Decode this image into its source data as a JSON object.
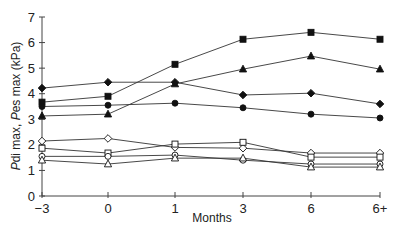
{
  "chart_data": {
    "type": "line",
    "title": "",
    "xlabel": "Months",
    "ylabel": "Pdi max, Pes max (kPa)",
    "ylabel_parts": [
      {
        "text": "P",
        "italic": true
      },
      {
        "text": "di max, ",
        "italic": false
      },
      {
        "text": "P",
        "italic": true
      },
      {
        "text": "es max (kPa)",
        "italic": false
      }
    ],
    "categories": [
      "-3",
      "0",
      "1",
      "3",
      "6",
      "6+"
    ],
    "x_tick_labels": [
      "−3",
      "0",
      "1",
      "3",
      "6",
      "6+"
    ],
    "y_ticks": [
      0,
      1,
      2,
      3,
      4,
      5,
      6,
      7
    ],
    "ylim": [
      0,
      7
    ],
    "grid": false,
    "legend": "none",
    "series": [
      {
        "name": "filled-square",
        "marker": "square",
        "filled": true,
        "values": [
          3.67,
          3.9,
          5.15,
          6.13,
          6.4,
          6.13
        ]
      },
      {
        "name": "filled-triangle",
        "marker": "triangle",
        "filled": true,
        "values": [
          3.13,
          3.2,
          4.38,
          4.96,
          5.47,
          4.96
        ]
      },
      {
        "name": "filled-diamond",
        "marker": "diamond",
        "filled": true,
        "values": [
          4.22,
          4.45,
          4.45,
          3.95,
          4.02,
          3.6
        ]
      },
      {
        "name": "filled-circle",
        "marker": "circle",
        "filled": true,
        "values": [
          3.5,
          3.55,
          3.63,
          3.45,
          3.2,
          3.05
        ]
      },
      {
        "name": "open-diamond",
        "marker": "diamond",
        "filled": false,
        "values": [
          2.15,
          2.25,
          1.9,
          1.87,
          1.68,
          1.68
        ]
      },
      {
        "name": "open-square",
        "marker": "square",
        "filled": false,
        "values": [
          1.87,
          1.68,
          2.03,
          2.1,
          1.52,
          1.52
        ]
      },
      {
        "name": "open-circle",
        "marker": "circle",
        "filled": false,
        "values": [
          1.55,
          1.55,
          1.6,
          1.4,
          1.25,
          1.25
        ]
      },
      {
        "name": "open-triangle",
        "marker": "triangle",
        "filled": false,
        "values": [
          1.4,
          1.25,
          1.48,
          1.48,
          1.13,
          1.13
        ]
      }
    ]
  },
  "colors": {
    "line": "#333333",
    "axis": "#444444",
    "marker": "#111111"
  }
}
